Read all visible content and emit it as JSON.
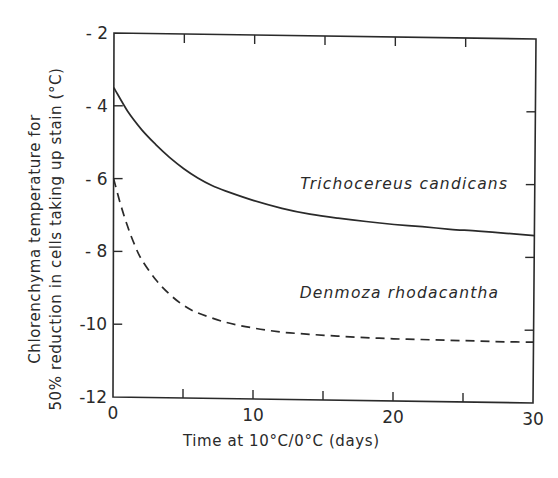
{
  "chart_data": {
    "type": "line",
    "title": "",
    "xlabel": "Time at 10°C/0°C  (days)",
    "ylabel_line1": "Chlorenchyma  temperature  for",
    "ylabel_line2": "50% reduction in cells taking up stain (°C)",
    "xlim": [
      0,
      30
    ],
    "ylim": [
      -12,
      -2
    ],
    "x_ticks": [
      0,
      10,
      20,
      30
    ],
    "x_tick_labels": [
      "0",
      "10",
      "20",
      "30"
    ],
    "x_minor_ticks": [
      5,
      15,
      25
    ],
    "y_ticks": [
      -2,
      -4,
      -6,
      -8,
      -10,
      -12
    ],
    "y_tick_labels": [
      "- 2",
      "- 4",
      "- 6",
      "- 8",
      "-10",
      "-12"
    ],
    "grid": false,
    "legend": "inline labels",
    "series": [
      {
        "name": "Trichocereus candicans",
        "style": "solid",
        "label_position": {
          "x": 13.3,
          "y": -6.2
        },
        "x": [
          0,
          1,
          2,
          3,
          4,
          5,
          6,
          7,
          8,
          10,
          12,
          14,
          16,
          18,
          20,
          22,
          24,
          26,
          28,
          30
        ],
        "values": [
          -3.5,
          -4.15,
          -4.65,
          -5.05,
          -5.4,
          -5.7,
          -5.95,
          -6.15,
          -6.3,
          -6.55,
          -6.75,
          -6.9,
          -7.0,
          -7.08,
          -7.15,
          -7.2,
          -7.26,
          -7.3,
          -7.35,
          -7.4
        ]
      },
      {
        "name": "Denmoza rhodacantha",
        "style": "dashed",
        "label_position": {
          "x": 13.3,
          "y": -9.2
        },
        "x": [
          0,
          0.5,
          1,
          1.5,
          2,
          3,
          4,
          5,
          6,
          8,
          10,
          12,
          14,
          16,
          18,
          20,
          22,
          24,
          26,
          28,
          30
        ],
        "values": [
          -6.0,
          -6.7,
          -7.3,
          -7.8,
          -8.2,
          -8.75,
          -9.15,
          -9.45,
          -9.65,
          -9.9,
          -10.05,
          -10.15,
          -10.2,
          -10.24,
          -10.27,
          -10.29,
          -10.3,
          -10.31,
          -10.32,
          -10.33,
          -10.33
        ]
      }
    ]
  },
  "colors": {
    "ink": "#2a2a2a",
    "background": "#ffffff"
  }
}
